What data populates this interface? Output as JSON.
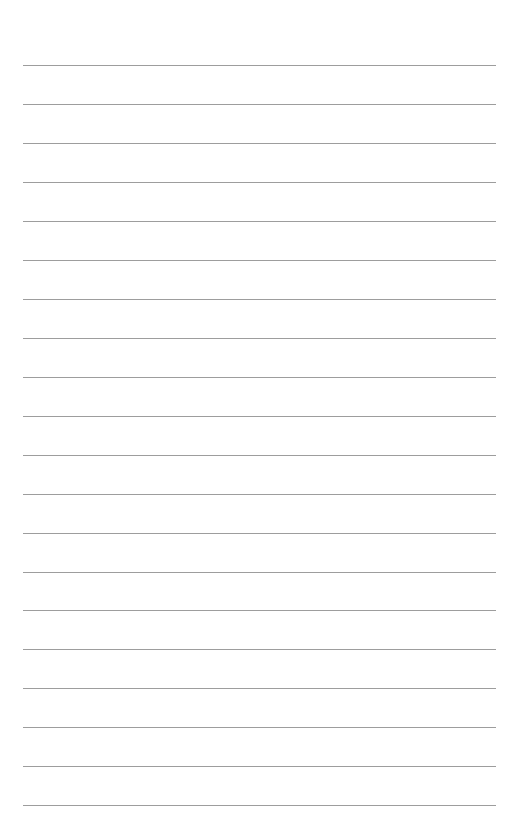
{
  "page": {
    "type": "lined-paper",
    "background_color": "#ffffff",
    "line_color": "#8c8c8c",
    "line_count": 20,
    "line_left_x": 23,
    "line_right_x": 496,
    "lines_y": [
      65,
      104,
      143,
      182,
      221,
      260,
      299,
      338,
      377,
      416,
      455,
      494,
      533,
      572,
      610,
      649,
      688,
      727,
      766,
      805
    ]
  }
}
